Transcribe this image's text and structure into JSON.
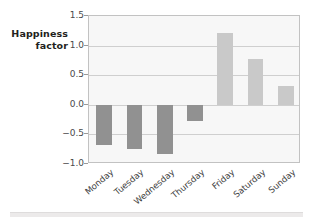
{
  "axis_label": {
    "line1": "Happiness",
    "line2": "factor"
  },
  "colors": {
    "negative_bar": "#919191",
    "positive_bar": "#c9c9c9",
    "plot_background": "#f7f7f7",
    "gridline": "#cfcfcf",
    "frame": "#c2c2c2",
    "text": "#3d3d3d"
  },
  "yticks": [
    "1.5",
    "1.0",
    "0.5",
    "0.0",
    "-0.5",
    "-1.0"
  ],
  "chart_data": {
    "type": "bar",
    "title": "",
    "xlabel": "",
    "ylabel": "Happiness factor",
    "categories": [
      "Monday",
      "Tuesday",
      "Wednesday",
      "Thursday",
      "Friday",
      "Saturday",
      "Sunday"
    ],
    "values": [
      -0.68,
      -0.75,
      -0.83,
      -0.28,
      1.22,
      0.77,
      0.32
    ],
    "ylim": [
      -1.0,
      1.5
    ],
    "ytick_values": [
      1.5,
      1.0,
      0.5,
      0.0,
      -0.5,
      -1.0
    ],
    "grid": true,
    "legend": "none"
  }
}
